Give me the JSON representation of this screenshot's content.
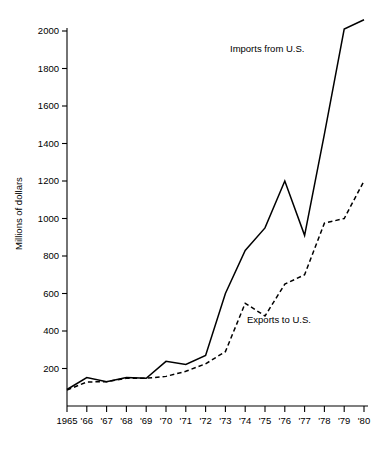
{
  "chart_data": {
    "type": "line",
    "title": "",
    "xlabel": "",
    "ylabel": "Millions of dollars",
    "categories": [
      "1965",
      "'66",
      "'67",
      "'68",
      "'69",
      "'70",
      "'71",
      "'72",
      "'73",
      "'74",
      "'75",
      "'76",
      "'77",
      "'78",
      "'79",
      "'80"
    ],
    "x": [
      1965,
      1966,
      1967,
      1968,
      1969,
      1970,
      1971,
      1972,
      1973,
      1974,
      1975,
      1976,
      1977,
      1978,
      1979,
      1980
    ],
    "series": [
      {
        "name": "Imports from U.S.",
        "style": "solid",
        "values": [
          88,
          152,
          130,
          152,
          148,
          238,
          222,
          270,
          600,
          830,
          950,
          1200,
          910,
          1450,
          2010,
          2060
        ]
      },
      {
        "name": "Exports to U.S.",
        "style": "dashed",
        "values": [
          85,
          128,
          130,
          148,
          148,
          158,
          185,
          225,
          290,
          548,
          480,
          650,
          700,
          975,
          1000,
          1200
        ]
      }
    ],
    "ylim": [
      0,
      2100
    ],
    "yticks": [
      200,
      400,
      600,
      800,
      1000,
      1200,
      1400,
      1600,
      1800,
      2000
    ],
    "ytick_labels": [
      "200",
      "400",
      "600",
      "800",
      "1000",
      "1200",
      "1400",
      "1600",
      "1800",
      "2000"
    ],
    "xlim": [
      1965,
      1980
    ],
    "grid": false,
    "legend_position": "inline-annotations",
    "annotations": [
      {
        "text": "Imports from U.S.",
        "x_px": 230,
        "y_px": 52
      },
      {
        "text": "Exports to U.S.",
        "x_px": 247,
        "y_px": 323
      }
    ],
    "colors": {
      "line": "#000000",
      "background": "#ffffff",
      "axis": "#000000"
    }
  },
  "axis": {
    "y_title": "Millions of dollars"
  }
}
